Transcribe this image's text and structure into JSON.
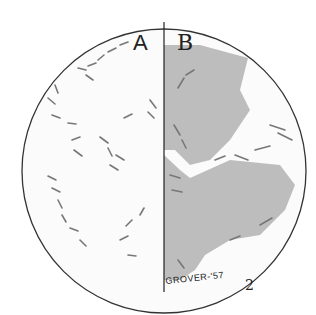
{
  "figure": {
    "panel_a_label": "A",
    "panel_b_label": "B",
    "signature": "GROVER-'57",
    "figure_number": "2"
  }
}
